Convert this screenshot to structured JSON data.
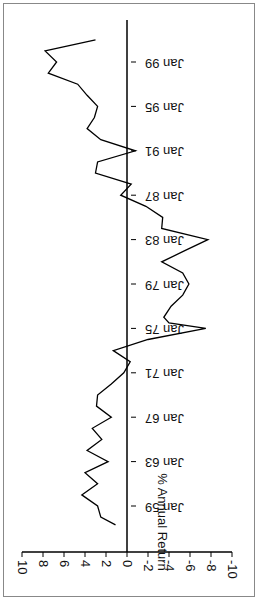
{
  "chart_data": {
    "type": "line",
    "title": "",
    "xlabel": "",
    "ylabel": "% Annual Return",
    "ylim": [
      -10,
      10
    ],
    "yticks": [
      10,
      8,
      6,
      4,
      2,
      0,
      -2,
      -4,
      -6,
      -8,
      -10
    ],
    "xticks": [
      "Jan 59",
      "Jan 63",
      "Jan 67",
      "Jan 71",
      "Jan 75",
      "Jan 79",
      "Jan 83",
      "Jan 87",
      "Jan 91",
      "Jan 95",
      "Jan 99"
    ],
    "orientation": "rotated 90 degrees clockwise",
    "grid": false,
    "x": [
      1957.3,
      1958,
      1959,
      1960,
      1961,
      1962,
      1963,
      1964,
      1965,
      1966,
      1967,
      1968,
      1969,
      1970,
      1971,
      1972,
      1973,
      1974,
      1975,
      1975.5,
      1976,
      1977,
      1978,
      1979,
      1980,
      1981,
      1982,
      1983,
      1984,
      1985,
      1986,
      1987,
      1988,
      1989,
      1990,
      1991,
      1992,
      1993,
      1994,
      1995,
      1996,
      1997,
      1998,
      1999,
      2000,
      2001
    ],
    "series": [
      {
        "name": "% Annual Return",
        "values": [
          1.1,
          2.5,
          2.8,
          4.3,
          2.8,
          4.0,
          1.8,
          3.8,
          2.4,
          3.3,
          1.5,
          2.9,
          2.8,
          1.5,
          0.3,
          -0.3,
          1.3,
          -2.0,
          -7.5,
          -4.0,
          -3.5,
          -4.2,
          -5.3,
          -5.9,
          -5.3,
          -3.3,
          -5.5,
          -7.7,
          -3.3,
          -3.4,
          -1.8,
          0.6,
          -0.4,
          3.0,
          2.8,
          -0.8,
          2.5,
          3.8,
          3.1,
          2.8,
          3.8,
          4.7,
          7.5,
          6.7,
          7.8,
          3.0
        ]
      }
    ]
  }
}
